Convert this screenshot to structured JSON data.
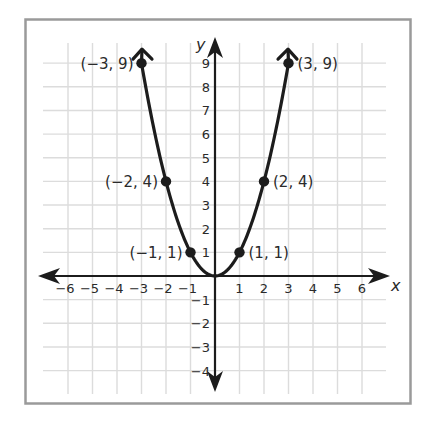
{
  "chart_data": {
    "type": "line",
    "title": "",
    "function": "y = x^2",
    "xlabel": "x",
    "ylabel": "y",
    "xlim": [
      -6,
      6
    ],
    "ylim": [
      -4,
      9
    ],
    "grid": true,
    "x_ticks": [
      "−6",
      "−5",
      "−4",
      "−3",
      "−2",
      "−1",
      "1",
      "2",
      "3",
      "4",
      "5",
      "6"
    ],
    "y_ticks": [
      "9",
      "8",
      "7",
      "6",
      "5",
      "4",
      "3",
      "2",
      "1",
      "−1",
      "−2",
      "−3",
      "−4"
    ],
    "series": [
      {
        "name": "parabola",
        "x": [
          -3,
          -2,
          -1,
          0,
          1,
          2,
          3
        ],
        "y": [
          9,
          4,
          1,
          0,
          1,
          4,
          9
        ]
      }
    ],
    "labeled_points": [
      {
        "x": -3,
        "y": 9,
        "label": "(−3, 9)"
      },
      {
        "x": -2,
        "y": 4,
        "label": "(−2, 4)"
      },
      {
        "x": -1,
        "y": 1,
        "label": "(−1, 1)"
      },
      {
        "x": 1,
        "y": 1,
        "label": "(1, 1)"
      },
      {
        "x": 2,
        "y": 4,
        "label": "(2, 4)"
      },
      {
        "x": 3,
        "y": 9,
        "label": "(3, 9)"
      }
    ],
    "colors": {
      "curve": "#1c1c1c",
      "grid": "#dcdcdc",
      "frame": "#9a9a9a",
      "axis": "#1c1c1c"
    }
  }
}
